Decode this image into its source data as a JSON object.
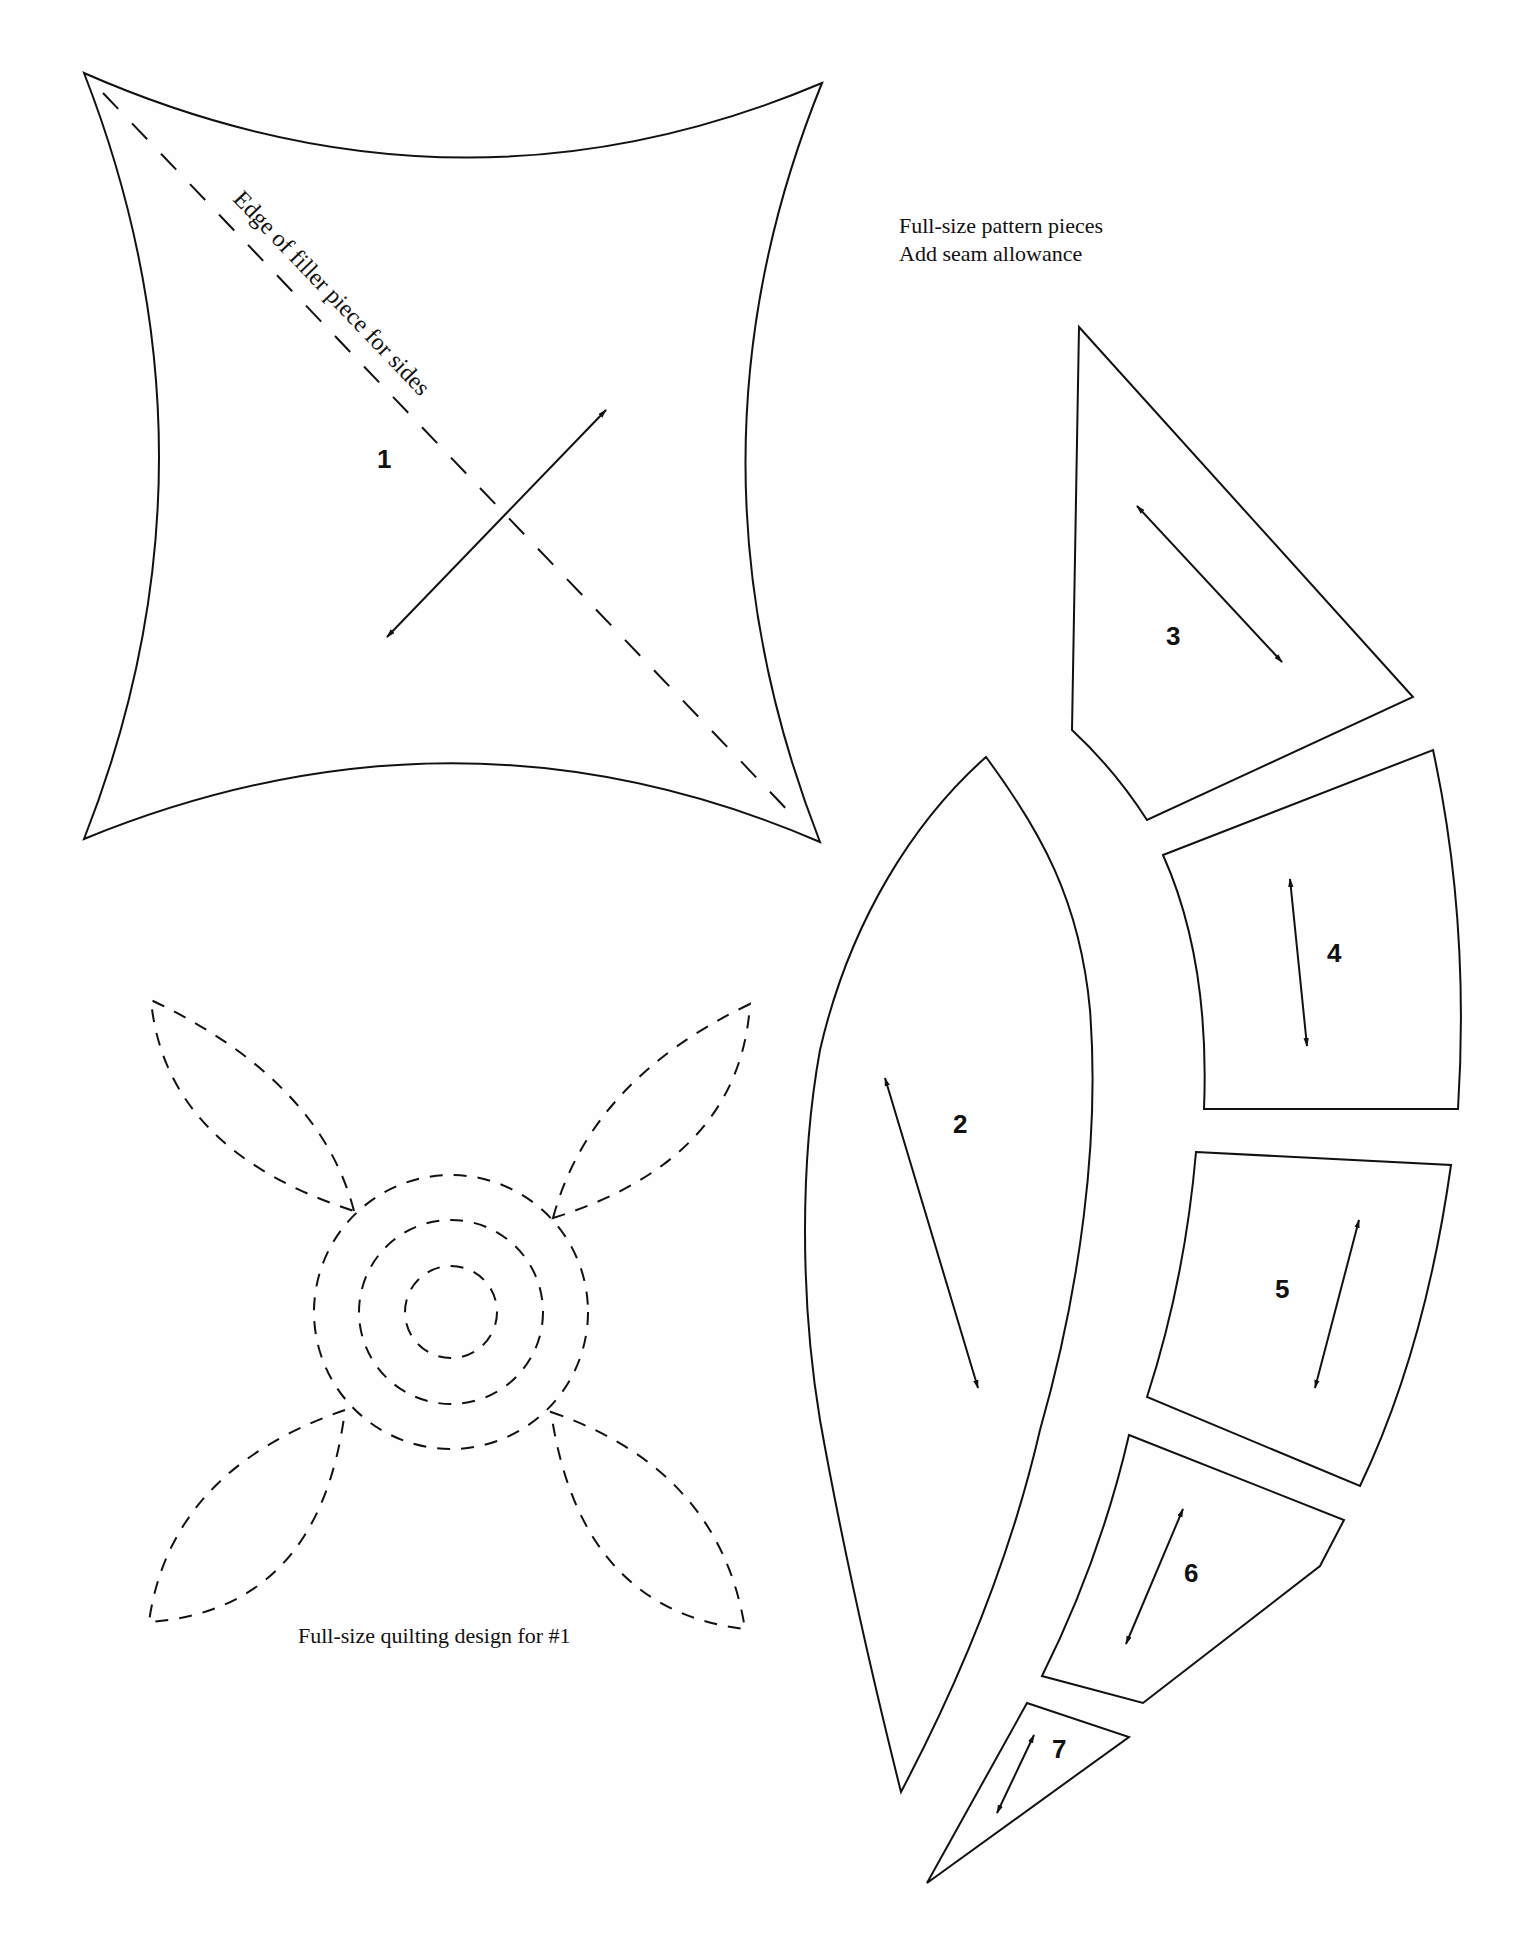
{
  "header_note": {
    "line1": "Full-size pattern pieces",
    "line2": "Add seam allowance"
  },
  "piece1": {
    "number": "1",
    "edge_label": "Edge of filler piece for sides"
  },
  "pieces": {
    "p2": {
      "number": "2"
    },
    "p3": {
      "number": "3"
    },
    "p4": {
      "number": "4"
    },
    "p5": {
      "number": "5"
    },
    "p6": {
      "number": "6"
    },
    "p7": {
      "number": "7"
    }
  },
  "quilting": {
    "caption": "Full-size quilting design for #1"
  },
  "colors": {
    "ink": "#111111",
    "paper": "#fefefe"
  }
}
